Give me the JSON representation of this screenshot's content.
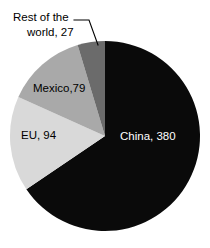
{
  "chart_data": {
    "type": "pie",
    "title": "",
    "subtitle": "",
    "xlabel": "",
    "ylabel": "",
    "legend_position": "none",
    "grid": false,
    "total": 580,
    "units": "",
    "categories": [
      "China",
      "EU",
      "Mexico",
      "Rest of the world"
    ],
    "values": [
      380,
      94,
      79,
      27
    ],
    "start_angle_deg": 0,
    "direction": "clockwise",
    "slices": [
      {
        "name": "China",
        "value": 380,
        "label": "China, 380",
        "percent": 65.5,
        "color": "#0a0a0a",
        "label_color": "#ffffff",
        "label_placement": "inside",
        "start_deg": 0,
        "end_deg": 235.9
      },
      {
        "name": "EU",
        "value": 94,
        "label": "EU, 94",
        "percent": 16.2,
        "color": "#d9d9d9",
        "label_color": "#000000",
        "label_placement": "inside",
        "start_deg": 235.9,
        "end_deg": 294.2
      },
      {
        "name": "Mexico",
        "value": 79,
        "label": "Mexico,79",
        "percent": 13.6,
        "color": "#a9a9a9",
        "label_color": "#000000",
        "label_placement": "inside",
        "start_deg": 294.2,
        "end_deg": 343.2
      },
      {
        "name": "Rest of the world",
        "value": 27,
        "label_line1": "Rest of the",
        "label_line2": "world, 27",
        "percent": 4.7,
        "color": "#6b6b6b",
        "label_color": "#000000",
        "label_placement": "callout",
        "start_deg": 343.2,
        "end_deg": 360
      }
    ]
  },
  "canvas": {
    "background": "#ffffff",
    "center_x": 105,
    "center_y": 136,
    "radius": 95
  }
}
